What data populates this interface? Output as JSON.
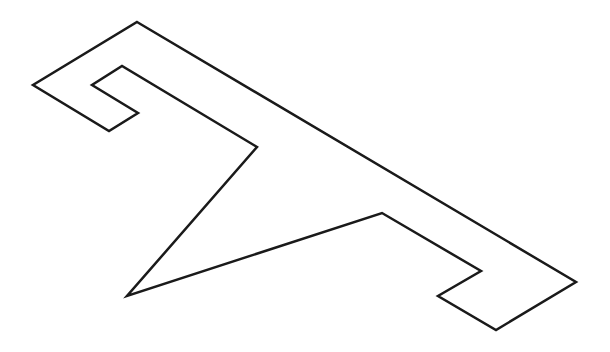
{
  "diagram": {
    "type": "outline-polygon",
    "stroke_color": "#1a1a1a",
    "stroke_width": 2.5,
    "fill": "none",
    "background": "#ffffff",
    "vertices": [
      [
        137,
        22
      ],
      [
        576,
        282
      ],
      [
        496,
        330
      ],
      [
        438,
        296
      ],
      [
        481,
        271
      ],
      [
        382,
        213
      ],
      [
        127,
        296
      ],
      [
        257,
        147
      ],
      [
        122,
        66
      ],
      [
        92,
        85
      ],
      [
        138,
        113
      ],
      [
        109,
        131
      ],
      [
        33,
        85
      ]
    ]
  }
}
